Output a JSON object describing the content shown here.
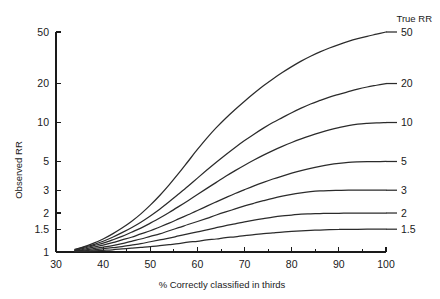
{
  "chart_data": {
    "type": "line",
    "title": "",
    "xlabel": "% Correctly classified in thirds",
    "ylabel": "Observed RR",
    "legend_title": "True RR",
    "legend_position": "right-outside",
    "grid": false,
    "yscale": "log",
    "xlim": [
      30,
      100
    ],
    "ylim": [
      1,
      50
    ],
    "xticks": [
      30,
      40,
      50,
      60,
      70,
      80,
      90,
      100
    ],
    "xticklabels": [
      "30",
      "40",
      "50",
      "60",
      "70",
      "80",
      "90",
      "100"
    ],
    "xminorticks": [
      35,
      45,
      55,
      65,
      75,
      85,
      95
    ],
    "yticks": [
      1,
      1.5,
      2,
      3,
      5,
      10,
      20,
      50
    ],
    "yticklabels": [
      "1",
      "1.5",
      "2",
      "3",
      "5",
      "10",
      "20",
      "50"
    ],
    "x": [
      34,
      36,
      38,
      40,
      42,
      44,
      46,
      48,
      50,
      52,
      54,
      56,
      58,
      60,
      62,
      64,
      66,
      68,
      70,
      72,
      74,
      76,
      78,
      80,
      82,
      84,
      86,
      88,
      90,
      92,
      94,
      96,
      98,
      100
    ],
    "series": [
      {
        "name": "50",
        "label": "50",
        "true_rr": 50,
        "values": [
          1.05,
          1.1,
          1.17,
          1.26,
          1.38,
          1.53,
          1.72,
          1.97,
          2.3,
          2.73,
          3.3,
          4.04,
          5.0,
          6.19,
          7.58,
          9.12,
          10.8,
          12.6,
          14.6,
          16.8,
          19.2,
          21.7,
          24.3,
          27.0,
          29.8,
          32.5,
          35.1,
          37.6,
          40.0,
          42.3,
          44.4,
          46.3,
          48.1,
          50.0
        ]
      },
      {
        "name": "20",
        "label": "20",
        "true_rr": 20,
        "values": [
          1.04,
          1.09,
          1.14,
          1.21,
          1.3,
          1.41,
          1.54,
          1.7,
          1.9,
          2.14,
          2.44,
          2.8,
          3.22,
          3.72,
          4.29,
          4.93,
          5.64,
          6.42,
          7.25,
          8.13,
          9.05,
          9.99,
          10.9,
          11.9,
          12.9,
          13.9,
          14.8,
          15.7,
          16.5,
          17.3,
          18.1,
          18.8,
          19.4,
          20.0
        ]
      },
      {
        "name": "10",
        "label": "10",
        "true_rr": 10,
        "values": [
          1.03,
          1.07,
          1.12,
          1.17,
          1.24,
          1.32,
          1.42,
          1.53,
          1.67,
          1.83,
          2.02,
          2.24,
          2.49,
          2.78,
          3.1,
          3.45,
          3.84,
          4.25,
          4.68,
          5.13,
          5.6,
          6.07,
          6.54,
          7.01,
          7.47,
          7.92,
          8.35,
          8.76,
          9.14,
          9.48,
          9.7,
          9.84,
          9.94,
          10.0
        ]
      },
      {
        "name": "5",
        "label": "5",
        "true_rr": 5,
        "values": [
          1.02,
          1.05,
          1.09,
          1.13,
          1.18,
          1.24,
          1.3,
          1.38,
          1.46,
          1.56,
          1.67,
          1.8,
          1.94,
          2.09,
          2.26,
          2.44,
          2.63,
          2.83,
          3.03,
          3.24,
          3.45,
          3.66,
          3.86,
          4.06,
          4.25,
          4.43,
          4.59,
          4.73,
          4.84,
          4.92,
          4.96,
          4.98,
          4.99,
          5.0
        ]
      },
      {
        "name": "3",
        "label": "3",
        "true_rr": 3,
        "values": [
          1.015,
          1.035,
          1.06,
          1.09,
          1.12,
          1.16,
          1.21,
          1.26,
          1.32,
          1.38,
          1.46,
          1.54,
          1.63,
          1.72,
          1.82,
          1.93,
          2.04,
          2.15,
          2.27,
          2.38,
          2.49,
          2.6,
          2.7,
          2.79,
          2.86,
          2.92,
          2.96,
          2.98,
          2.99,
          3.0,
          3.0,
          3.0,
          3.0,
          3.0
        ]
      },
      {
        "name": "2",
        "label": "2",
        "true_rr": 2,
        "values": [
          1.01,
          1.02,
          1.04,
          1.06,
          1.08,
          1.1,
          1.13,
          1.16,
          1.2,
          1.24,
          1.28,
          1.33,
          1.38,
          1.43,
          1.48,
          1.54,
          1.6,
          1.65,
          1.71,
          1.76,
          1.81,
          1.86,
          1.9,
          1.93,
          1.96,
          1.97,
          1.98,
          1.99,
          1.99,
          2.0,
          2.0,
          2.0,
          2.0,
          2.0
        ]
      },
      {
        "name": "1.5",
        "label": "1.5",
        "true_rr": 1.5,
        "values": [
          1.005,
          1.012,
          1.02,
          1.03,
          1.04,
          1.055,
          1.07,
          1.085,
          1.1,
          1.12,
          1.14,
          1.16,
          1.19,
          1.21,
          1.24,
          1.26,
          1.29,
          1.31,
          1.34,
          1.36,
          1.385,
          1.405,
          1.425,
          1.44,
          1.455,
          1.468,
          1.478,
          1.486,
          1.492,
          1.496,
          1.498,
          1.499,
          1.5,
          1.5
        ]
      }
    ]
  }
}
